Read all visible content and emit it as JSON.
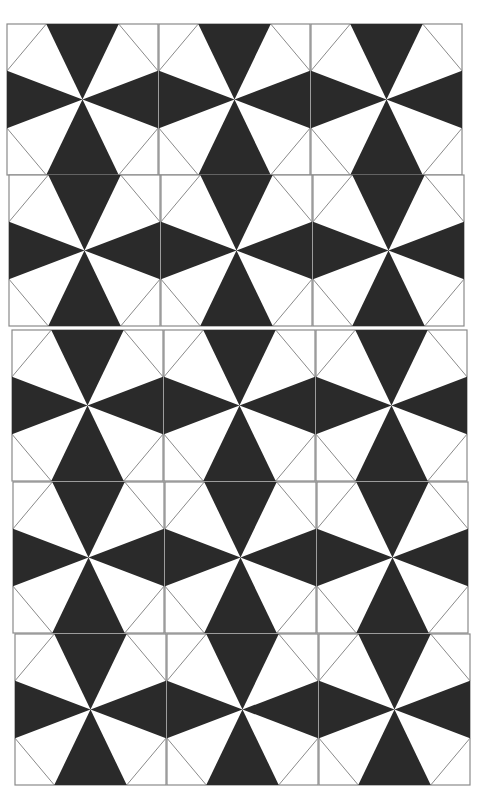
{
  "pattern": {
    "name": "kite-star tile pattern",
    "columns": 3,
    "rows": 5,
    "tile_size": 151,
    "fill_color": "#2a2a2a",
    "line_color": "#8a8a8a",
    "background": "#ffffff",
    "row_tops": [
      24,
      175,
      330,
      482,
      634
    ],
    "row_lefts": [
      7,
      9,
      12,
      13,
      15
    ],
    "triangle_half_width_ratio": 0.24,
    "side_triangle_span_ratio": [
      0.31,
      0.69
    ]
  }
}
